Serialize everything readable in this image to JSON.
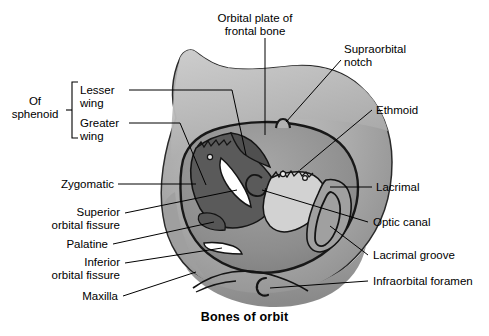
{
  "figure": {
    "title": "Bones of orbit",
    "group_bracket": {
      "label": "Of\nsphenoid",
      "members": [
        "Lesser\nwing",
        "Greater\nwing"
      ]
    },
    "labels": [
      {
        "id": "orbital-plate-of-frontal-bone",
        "text": "Orbital plate of\nfrontal bone",
        "align": "center",
        "x": 221,
        "y": 12
      },
      {
        "id": "supraorbital-notch",
        "text": "Supraorbital\nnotch",
        "align": "left",
        "x": 344,
        "y": 43
      },
      {
        "id": "lesser-wing",
        "text": "Lesser\nwing",
        "align": "left",
        "x": 78,
        "y": 84
      },
      {
        "id": "greater-wing",
        "text": "Greater\nwing",
        "align": "left",
        "x": 70,
        "y": 117
      },
      {
        "id": "of-sphenoid",
        "text": "Of\nsphenoid",
        "align": "center",
        "x": 7,
        "y": 95
      },
      {
        "id": "ethmoid",
        "text": "Ethmoid",
        "align": "left",
        "x": 375,
        "y": 104
      },
      {
        "id": "zygomatic",
        "text": "Zygomatic",
        "align": "right",
        "x": 56,
        "y": 178
      },
      {
        "id": "lacrimal",
        "text": "Lacrimal",
        "align": "left",
        "x": 375,
        "y": 181
      },
      {
        "id": "superior-orbital-fissure",
        "text": "Superior\norbital fissure",
        "align": "right",
        "x": 20,
        "y": 206
      },
      {
        "id": "optic-canal",
        "text": "Optic canal",
        "align": "left",
        "x": 371,
        "y": 216
      },
      {
        "id": "palatine",
        "text": "Palatine",
        "align": "right",
        "x": 61,
        "y": 238
      },
      {
        "id": "lacrimal-groove",
        "text": "Lacrimal groove",
        "align": "left",
        "x": 371,
        "y": 249
      },
      {
        "id": "inferior-orbital-fissure",
        "text": "Inferior\norbital fissure",
        "align": "right",
        "x": 20,
        "y": 256
      },
      {
        "id": "infraorbital-foramen",
        "text": "Infraorbital foramen",
        "align": "left",
        "x": 371,
        "y": 275
      },
      {
        "id": "maxilla",
        "text": "Maxilla",
        "align": "right",
        "x": 72,
        "y": 290
      }
    ],
    "colors": {
      "outline": "#1a1a1a",
      "bone_light": "#c9c9c9",
      "bone_mid": "#9a9a9a",
      "bone_dark": "#6e6e6e",
      "bone_darkest": "#4a4a4a",
      "highlight": "#ffffff",
      "background": "#ffffff",
      "leader_line": "#000000"
    }
  }
}
